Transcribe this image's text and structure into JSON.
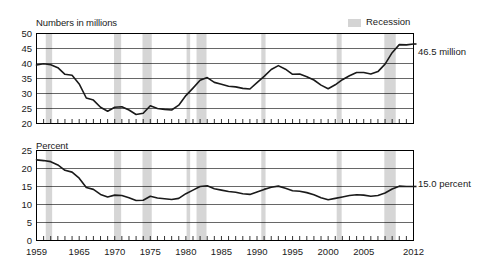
{
  "legend": {
    "recession_label": "Recession",
    "recession_color": "#d6d6d6"
  },
  "panels": {
    "top": {
      "axis_title": "Numbers in millions",
      "series_label": "Number in poverty",
      "end_label": "46.5 million",
      "yticks": [
        "50",
        "45",
        "40",
        "35",
        "30",
        "25",
        "20"
      ]
    },
    "bottom": {
      "axis_title": "Percent",
      "series_label": "Poverty rate",
      "end_label": "15.0 percent",
      "yticks": [
        "25",
        "20",
        "15",
        "10",
        "5",
        "0"
      ]
    }
  },
  "xticks": [
    "1959",
    "1965",
    "1970",
    "1975",
    "1980",
    "1985",
    "1990",
    "1995",
    "2000",
    "2005",
    "2012"
  ],
  "chart_data": {
    "type": "line",
    "xlabel": "",
    "grid": "horizontal",
    "legend_position": "top-right",
    "recession_bands": [
      [
        1960.3,
        1961.2
      ],
      [
        1969.9,
        1970.9
      ],
      [
        1973.9,
        1975.2
      ],
      [
        1980.1,
        1980.6
      ],
      [
        1981.5,
        1982.9
      ],
      [
        1990.6,
        1991.2
      ],
      [
        2001.2,
        2001.9
      ],
      [
        2007.9,
        2009.5
      ]
    ],
    "panels": [
      {
        "name": "Number in poverty",
        "ylabel": "Numbers in millions",
        "ylim": [
          20,
          50
        ],
        "yticks": [
          20,
          25,
          30,
          35,
          40,
          45,
          50
        ],
        "xlim": [
          1959,
          2012
        ],
        "annotation": "46.5 million",
        "x": [
          1959,
          1960,
          1961,
          1962,
          1963,
          1964,
          1965,
          1966,
          1967,
          1968,
          1969,
          1970,
          1971,
          1972,
          1973,
          1974,
          1975,
          1976,
          1977,
          1978,
          1979,
          1980,
          1981,
          1982,
          1983,
          1984,
          1985,
          1986,
          1987,
          1988,
          1989,
          1990,
          1991,
          1992,
          1993,
          1994,
          1995,
          1996,
          1997,
          1998,
          1999,
          2000,
          2001,
          2002,
          2003,
          2004,
          2005,
          2006,
          2007,
          2008,
          2009,
          2010,
          2011,
          2012
        ],
        "values": [
          39.5,
          39.9,
          39.6,
          38.6,
          36.4,
          36.1,
          33.2,
          28.5,
          27.8,
          25.4,
          24.1,
          25.4,
          25.6,
          24.5,
          23.0,
          23.4,
          25.9,
          25.0,
          24.7,
          24.5,
          26.1,
          29.3,
          31.8,
          34.4,
          35.3,
          33.7,
          33.1,
          32.4,
          32.2,
          31.7,
          31.5,
          33.6,
          35.7,
          38.0,
          39.3,
          38.1,
          36.4,
          36.5,
          35.6,
          34.5,
          32.8,
          31.6,
          32.9,
          34.6,
          35.9,
          37.0,
          37.0,
          36.5,
          37.3,
          39.8,
          43.6,
          46.3,
          46.2,
          46.5
        ]
      },
      {
        "name": "Poverty rate",
        "ylabel": "Percent",
        "ylim": [
          0,
          25
        ],
        "yticks": [
          0,
          5,
          10,
          15,
          20,
          25
        ],
        "xlim": [
          1959,
          2012
        ],
        "annotation": "15.0 percent",
        "x": [
          1959,
          1960,
          1961,
          1962,
          1963,
          1964,
          1965,
          1966,
          1967,
          1968,
          1969,
          1970,
          1971,
          1972,
          1973,
          1974,
          1975,
          1976,
          1977,
          1978,
          1979,
          1980,
          1981,
          1982,
          1983,
          1984,
          1985,
          1986,
          1987,
          1988,
          1989,
          1990,
          1991,
          1992,
          1993,
          1994,
          1995,
          1996,
          1997,
          1998,
          1999,
          2000,
          2001,
          2002,
          2003,
          2004,
          2005,
          2006,
          2007,
          2008,
          2009,
          2010,
          2011,
          2012
        ],
        "values": [
          22.4,
          22.2,
          21.9,
          21.0,
          19.5,
          19.0,
          17.3,
          14.7,
          14.2,
          12.8,
          12.1,
          12.6,
          12.5,
          11.9,
          11.1,
          11.2,
          12.3,
          11.8,
          11.6,
          11.4,
          11.7,
          13.0,
          14.0,
          15.0,
          15.2,
          14.4,
          14.0,
          13.6,
          13.4,
          13.0,
          12.8,
          13.5,
          14.2,
          14.8,
          15.1,
          14.5,
          13.8,
          13.7,
          13.3,
          12.7,
          11.9,
          11.3,
          11.7,
          12.1,
          12.5,
          12.7,
          12.6,
          12.3,
          12.5,
          13.2,
          14.3,
          15.1,
          15.0,
          15.0
        ]
      }
    ]
  }
}
